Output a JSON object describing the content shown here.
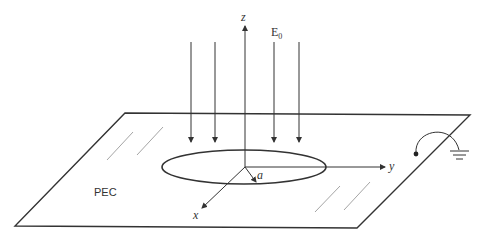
{
  "figure": {
    "labels": {
      "z_axis": "z",
      "y_axis": "y",
      "x_axis": "x",
      "field": "E",
      "field_subscript": "0",
      "radius": "a",
      "plane": "PEC"
    },
    "elements": {
      "incident_arrows_count": 4,
      "ground_symbol": "ground-icon",
      "probe_point": "terminal-dot"
    },
    "colors": {
      "stroke": "#333333",
      "hatch": "#9a9a9a",
      "background": "#ffffff"
    }
  }
}
